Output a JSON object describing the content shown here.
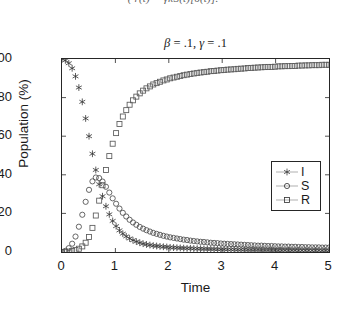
{
  "clipped_equation": "( r(t) = γκS(t)[δ(t)].",
  "chart_data": {
    "type": "scatter",
    "title": "β = .1, γ = .1",
    "title_parts": {
      "beta_symbol": "β",
      "beta_value": " = .1,  ",
      "gamma_symbol": "γ",
      "gamma_value": " = .1"
    },
    "xlabel": "Time",
    "ylabel": "Population (%)",
    "xlim": [
      0,
      5
    ],
    "ylim": [
      0,
      100
    ],
    "xticks": [
      "0",
      "1",
      "2",
      "3",
      "4",
      "5"
    ],
    "xtick_values": [
      0,
      1,
      2,
      3,
      4,
      5
    ],
    "yticks": [
      "0",
      "20",
      "40",
      "60",
      "80",
      "100"
    ],
    "ytick_values": [
      0,
      20,
      40,
      60,
      80,
      100
    ],
    "grid": false,
    "legend_position": "right",
    "box": true,
    "x": [
      0,
      0.063,
      0.127,
      0.19,
      0.253,
      0.316,
      0.38,
      0.443,
      0.506,
      0.57,
      0.633,
      0.696,
      0.759,
      0.823,
      0.886,
      0.949,
      1.013,
      1.076,
      1.139,
      1.203,
      1.266,
      1.329,
      1.392,
      1.456,
      1.519,
      1.582,
      1.646,
      1.709,
      1.772,
      1.835,
      1.899,
      1.962,
      2.025,
      2.089,
      2.152,
      2.215,
      2.278,
      2.342,
      2.405,
      2.468,
      2.532,
      2.595,
      2.658,
      2.722,
      2.785,
      2.848,
      2.911,
      2.975,
      3.038,
      3.101,
      3.165,
      3.228,
      3.291,
      3.354,
      3.418,
      3.481,
      3.544,
      3.608,
      3.671,
      3.734,
      3.797,
      3.861,
      3.924,
      3.987,
      4.051,
      4.114,
      4.177,
      4.241,
      4.304,
      4.367,
      4.43,
      4.494,
      4.557,
      4.62,
      4.684,
      4.747,
      4.81,
      4.873,
      4.937,
      5.0
    ],
    "series": [
      {
        "name": "I",
        "marker": "asterisk",
        "color": "#333333",
        "values": [
          100,
          99.3,
          97.8,
          95.2,
          91.0,
          85.2,
          77.8,
          69.2,
          60.0,
          50.9,
          42.5,
          35.1,
          28.9,
          23.7,
          19.5,
          16.1,
          13.4,
          11.2,
          9.5,
          8.1,
          7.0,
          6.1,
          5.4,
          4.8,
          4.3,
          3.9,
          3.6,
          3.3,
          3.1,
          2.9,
          2.7,
          2.6,
          2.4,
          2.3,
          2.2,
          2.1,
          2.0,
          1.9,
          1.9,
          1.8,
          1.7,
          1.7,
          1.6,
          1.6,
          1.5,
          1.5,
          1.4,
          1.4,
          1.4,
          1.3,
          1.3,
          1.3,
          1.2,
          1.2,
          1.2,
          1.1,
          1.1,
          1.1,
          1.1,
          1.0,
          1.0,
          1.0,
          1.0,
          1.0,
          0.9,
          0.9,
          0.9,
          0.9,
          0.9,
          0.9,
          0.8,
          0.8,
          0.8,
          0.8,
          0.8,
          0.8,
          0.8,
          0.7,
          0.7,
          0.7
        ]
      },
      {
        "name": "S",
        "marker": "circle",
        "color": "#4d4d4d",
        "values": [
          0,
          0.6,
          2.0,
          4.3,
          8.0,
          13.1,
          19.3,
          26.0,
          32.2,
          36.6,
          38.6,
          38.3,
          36.5,
          33.8,
          30.8,
          27.8,
          25.0,
          22.5,
          20.3,
          18.4,
          16.7,
          15.3,
          14.1,
          13.0,
          12.1,
          11.3,
          10.6,
          9.9,
          9.4,
          8.9,
          8.4,
          8.0,
          7.6,
          7.3,
          7.0,
          6.7,
          6.4,
          6.2,
          5.9,
          5.7,
          5.5,
          5.3,
          5.2,
          5.0,
          4.8,
          4.7,
          4.6,
          4.4,
          4.3,
          4.2,
          4.1,
          4.0,
          3.9,
          3.8,
          3.7,
          3.6,
          3.5,
          3.4,
          3.3,
          3.3,
          3.2,
          3.1,
          3.1,
          3.0,
          2.9,
          2.9,
          2.8,
          2.8,
          2.7,
          2.7,
          2.6,
          2.6,
          2.5,
          2.5,
          2.4,
          2.4,
          2.4,
          2.3,
          2.3,
          2.3
        ]
      },
      {
        "name": "R",
        "marker": "square",
        "color": "#5a5a5a",
        "values": [
          0,
          0.1,
          0.2,
          0.5,
          1.0,
          1.7,
          2.9,
          4.8,
          7.8,
          12.5,
          18.9,
          26.6,
          34.6,
          42.5,
          49.7,
          56.1,
          61.6,
          66.3,
          70.2,
          73.5,
          76.3,
          78.6,
          80.5,
          82.2,
          83.6,
          84.8,
          85.8,
          86.8,
          87.5,
          88.2,
          88.9,
          89.4,
          90.0,
          90.4,
          90.8,
          91.2,
          91.6,
          91.9,
          92.2,
          92.5,
          92.8,
          93.0,
          93.2,
          93.4,
          93.7,
          93.8,
          94.0,
          94.2,
          94.3,
          94.5,
          94.6,
          94.7,
          94.9,
          95.0,
          95.1,
          95.3,
          95.4,
          95.5,
          95.6,
          95.7,
          95.8,
          95.9,
          95.9,
          96.0,
          96.2,
          96.2,
          96.3,
          96.3,
          96.4,
          96.4,
          96.6,
          96.6,
          96.7,
          96.7,
          96.8,
          96.8,
          96.8,
          97.0,
          97.0,
          97.0
        ]
      }
    ],
    "legend": [
      {
        "label": "I",
        "marker": "asterisk"
      },
      {
        "label": "S",
        "marker": "circle"
      },
      {
        "label": "R",
        "marker": "square"
      }
    ]
  }
}
